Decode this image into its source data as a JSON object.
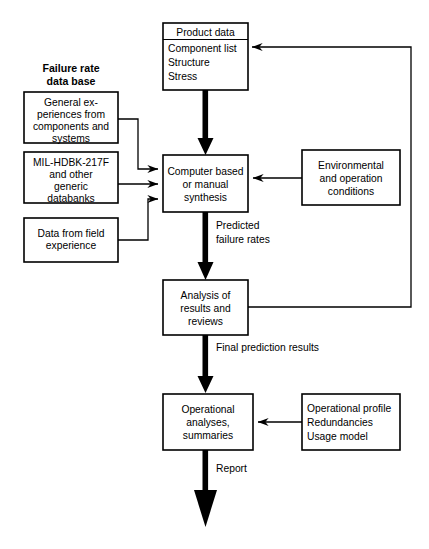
{
  "diagram": {
    "type": "flowchart",
    "section_headers": [
      {
        "id": "failure-rate-db",
        "lines": [
          "Failure rate",
          "data base"
        ]
      }
    ],
    "nodes": {
      "product_data": {
        "header": "Product data",
        "lines": [
          "Component list",
          "Structure",
          "Stress"
        ]
      },
      "general_experiences": {
        "lines": [
          "General ex-",
          "periences from",
          "components and",
          "systems"
        ]
      },
      "mil_hdbk": {
        "lines": [
          "MIL-HDBK-217F",
          "and other",
          "generic",
          "databanks"
        ]
      },
      "field_data": {
        "lines": [
          "Data from field",
          "experience"
        ]
      },
      "synthesis": {
        "lines": [
          "Computer based",
          "or manual",
          "synthesis"
        ]
      },
      "environmental": {
        "lines": [
          "Environmental",
          "and operation",
          "conditions"
        ]
      },
      "analysis": {
        "lines": [
          "Analysis of",
          "results and",
          "reviews"
        ]
      },
      "operational": {
        "lines": [
          "Operational",
          "analyses,",
          "summaries"
        ]
      },
      "operational_profile": {
        "lines": [
          "Operational profile",
          "Redundancies",
          "Usage model"
        ]
      }
    },
    "edge_labels": {
      "predicted_failure_rates": [
        "Predicted",
        "failure rates"
      ],
      "final_prediction_results": [
        "Final prediction results"
      ],
      "report": [
        "Report"
      ]
    },
    "colors": {
      "stroke": "#000000",
      "fill": "#ffffff",
      "text": "#000000"
    }
  }
}
